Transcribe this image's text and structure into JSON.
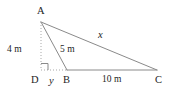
{
  "figure": {
    "type": "geometry-diagram",
    "stroke_color": "#8a8a8a",
    "text_color": "#1d1d1d",
    "background_color": "#ffffff"
  },
  "vertices": [
    {
      "id": "A",
      "label": "A",
      "x": 41,
      "y": 22,
      "label_x": 37,
      "label_y": 6
    },
    {
      "id": "D",
      "label": "D",
      "x": 41,
      "y": 70,
      "label_x": 31,
      "label_y": 75
    },
    {
      "id": "B",
      "label": "B",
      "x": 67,
      "y": 70,
      "label_x": 63,
      "label_y": 75
    },
    {
      "id": "C",
      "label": "C",
      "x": 157,
      "y": 70,
      "label_x": 155,
      "label_y": 75
    }
  ],
  "segments": [
    {
      "id": "AD",
      "from": "A",
      "to": "D",
      "style": "dotted",
      "measure": "4 m"
    },
    {
      "id": "DB",
      "from": "D",
      "to": "B",
      "style": "dotted",
      "measure": "y"
    },
    {
      "id": "AB",
      "from": "A",
      "to": "B",
      "style": "solid",
      "measure": "5 m"
    },
    {
      "id": "AC",
      "from": "A",
      "to": "C",
      "style": "solid",
      "measure": "x"
    },
    {
      "id": "BC",
      "from": "B",
      "to": "C",
      "style": "solid",
      "measure": "10 m"
    }
  ],
  "markers": {
    "right_angle_at": "D",
    "right_angle_size": 7
  },
  "labels": {
    "side_ad": "4 m",
    "side_ab": "5 m",
    "side_ac": "x",
    "side_db": "y",
    "side_bc": "10 m",
    "vertex_a": "A",
    "vertex_b": "B",
    "vertex_c": "C",
    "vertex_d": "D"
  }
}
